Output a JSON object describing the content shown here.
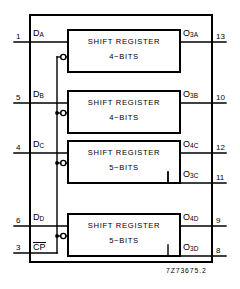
{
  "diagram": {
    "caption": "7Z73675.2",
    "line_color": "#000000",
    "background": "#ffffff",
    "blocks": [
      {
        "id": "A",
        "name": "SHIFT REGISTER",
        "size": "4−BITS",
        "input": {
          "pin": "1",
          "signal": "D",
          "sub": "A"
        },
        "outputs": [
          {
            "pin": "13",
            "signal": "O",
            "sub": "3A"
          }
        ]
      },
      {
        "id": "B",
        "name": "SHIFT REGISTER",
        "size": "4−BITS",
        "input": {
          "pin": "5",
          "signal": "D",
          "sub": "B"
        },
        "outputs": [
          {
            "pin": "10",
            "signal": "O",
            "sub": "3B"
          }
        ]
      },
      {
        "id": "C",
        "name": "SHIFT REGISTER",
        "size": "5−BITS",
        "input": {
          "pin": "4",
          "signal": "D",
          "sub": "C"
        },
        "outputs": [
          {
            "pin": "12",
            "signal": "O",
            "sub": "4C"
          },
          {
            "pin": "11",
            "signal": "O",
            "sub": "3C"
          }
        ]
      },
      {
        "id": "D",
        "name": "SHIFT REGISTER",
        "size": "5−BITS",
        "input": {
          "pin": "6",
          "signal": "D",
          "sub": "D"
        },
        "outputs": [
          {
            "pin": "9",
            "signal": "O",
            "sub": "4D"
          },
          {
            "pin": "8",
            "signal": "O",
            "sub": "3D"
          }
        ]
      }
    ],
    "clock": {
      "pin": "3",
      "signal": "CP",
      "overbar": true,
      "inverting_bubbles": 4
    }
  }
}
